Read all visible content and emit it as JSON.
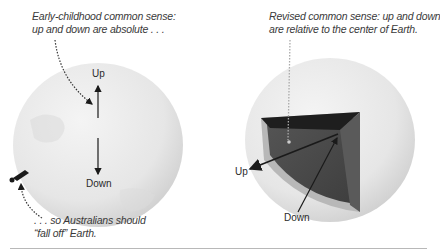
{
  "left_panel": {
    "caption_top_line1": "Early-childhood common sense:",
    "caption_top_line2": "up and down are absolute . . .",
    "label_up": "Up",
    "label_down": "Down",
    "caption_bottom_line1": ". . . so Australians should",
    "caption_bottom_line2": "“fall off” Earth."
  },
  "right_panel": {
    "caption_line1": "Revised common sense: up and down",
    "caption_line2": "are relative to the center of Earth.",
    "label_up": "Up",
    "label_down": "Down"
  },
  "colors": {
    "globe_light": "#ececec",
    "globe_shade": "#c8c8c8",
    "cutaway_dark": "#4a4a4a",
    "cutaway_top": "#1e1e1e",
    "text": "#333333"
  }
}
